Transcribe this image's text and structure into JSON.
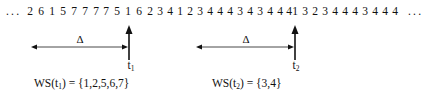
{
  "diagram": {
    "type": "working-set-reference-string",
    "reference_string": {
      "leading_ellipsis": "...",
      "trailing_ellipsis": "...",
      "tokens": [
        "2",
        "6",
        "1",
        "5",
        "7",
        "7",
        "7",
        "7",
        "5",
        "1",
        "6",
        "2",
        "3",
        "4",
        "1",
        "2",
        "3",
        "4",
        "4",
        "4",
        "3",
        "4",
        "3",
        "4",
        "4",
        "4",
        "1",
        "3",
        "2",
        "3",
        "4",
        "4",
        "4",
        "3",
        "4",
        "4",
        "4"
      ]
    },
    "markers": [
      {
        "id": "t1",
        "time_label": "t",
        "time_sub": "1",
        "token_index": 9,
        "window_label": "Δ",
        "working_set_prefix": "WS(t",
        "working_set_sub": "1",
        "working_set_suffix": ") = {1,2,5,6,7}"
      },
      {
        "id": "t2",
        "time_label": "t",
        "time_sub": "2",
        "token_index": 26,
        "window_label": "Δ",
        "working_set_prefix": "WS(t",
        "working_set_sub": "2",
        "working_set_suffix": ") = {3,4}"
      }
    ],
    "colors": {
      "ink": "#111111",
      "background": "#ffffff"
    }
  }
}
